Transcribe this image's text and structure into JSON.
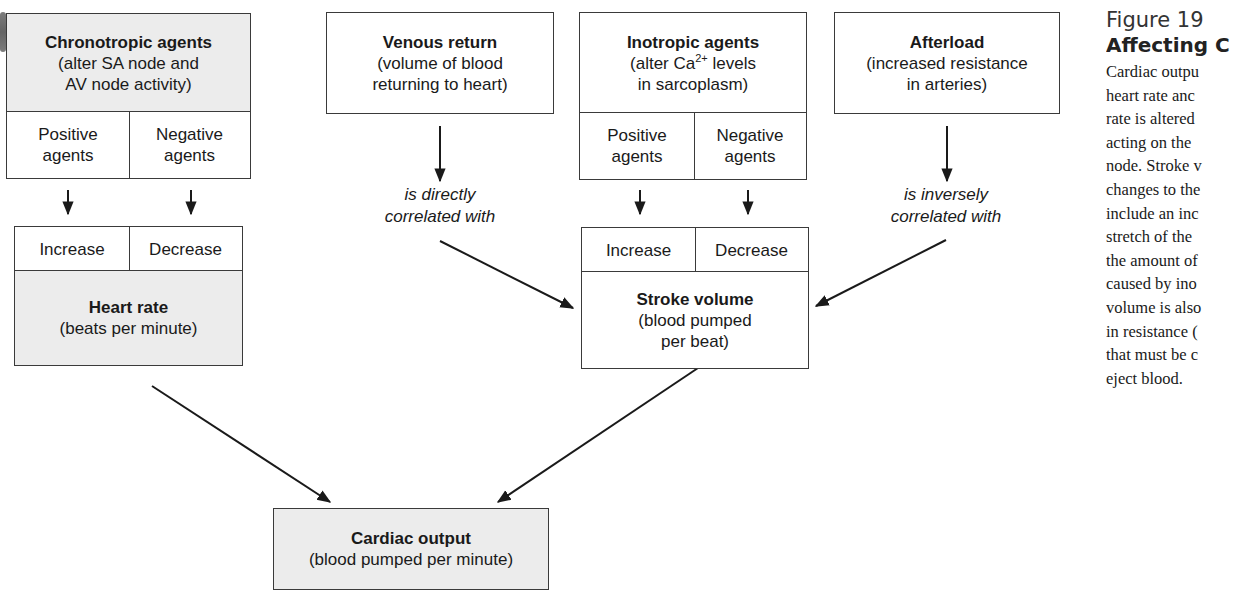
{
  "diagram": {
    "nodes": {
      "chronotropic": {
        "title": "Chronotropic agents",
        "line1": "(alter SA node and",
        "line2": "AV node activity)",
        "left": {
          "line1": "Positive",
          "line2": "agents"
        },
        "right": {
          "line1": "Negative",
          "line2": "agents"
        }
      },
      "heart_rate": {
        "left": "Increase",
        "right": "Decrease",
        "title": "Heart rate",
        "subtitle": "(beats per minute)"
      },
      "venous_return": {
        "title": "Venous return",
        "line1": "(volume of blood",
        "line2": "returning to heart)"
      },
      "inotropic": {
        "title": "Inotropic agents",
        "line1_pre": "(alter Ca",
        "line1_sup": "2+",
        "line1_post": " levels",
        "line2": "in sarcoplasm)",
        "left": {
          "line1": "Positive",
          "line2": "agents"
        },
        "right": {
          "line1": "Negative",
          "line2": "agents"
        }
      },
      "afterload": {
        "title": "Afterload",
        "line1": "(increased resistance",
        "line2": "in arteries)"
      },
      "stroke_volume": {
        "left": "Increase",
        "right": "Decrease",
        "title": "Stroke volume",
        "line1": "(blood pumped",
        "line2": "per beat)"
      },
      "cardiac_output": {
        "title": "Cardiac output",
        "subtitle": "(blood pumped per minute)"
      }
    },
    "edge_labels": {
      "venous": {
        "line1": "is directly",
        "line2": "correlated with"
      },
      "afterload": {
        "line1": "is inversely",
        "line2": "correlated with"
      }
    },
    "colors": {
      "box_border": "#3a3a3a",
      "shaded_fill": "#ececec",
      "arrow": "#1a1a1a"
    }
  },
  "caption": {
    "title": "Figure 19",
    "subtitle": "Affecting C",
    "lines": [
      "Cardiac outpu",
      "heart rate anc",
      "rate is altered",
      "acting on the",
      "node. Stroke v",
      "changes to the",
      "include an inc",
      "stretch of the",
      "the amount of",
      "caused by ino",
      "volume is also",
      "in resistance (",
      "that must be c",
      "eject blood."
    ]
  }
}
